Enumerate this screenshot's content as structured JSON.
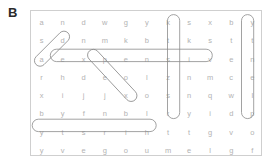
{
  "panel": {
    "label": "B"
  },
  "colors": {
    "letter": "#b3b3b3",
    "border": "#cfcfcf",
    "circle": "#8a8a8a",
    "label": "#2b2b2b",
    "background": "#ffffff"
  },
  "puzzle": {
    "rows": 8,
    "cols": 11,
    "grid": [
      [
        "a",
        "n",
        "d",
        "w",
        "g",
        "y",
        "k",
        "s",
        "x",
        "b",
        "y"
      ],
      [
        "s",
        "d",
        "n",
        "m",
        "k",
        "b",
        "t",
        "k",
        "s",
        "t",
        "t"
      ],
      [
        "a",
        "e",
        "x",
        "p",
        "e",
        "n",
        "s",
        "i",
        "v",
        "e",
        "n"
      ],
      [
        "r",
        "h",
        "d",
        "e",
        "o",
        "l",
        "z",
        "n",
        "m",
        "c",
        "e"
      ],
      [
        "x",
        "i",
        "j",
        "j",
        "x",
        "o",
        "s",
        "n",
        "q",
        "w",
        "l"
      ],
      [
        "b",
        "y",
        "f",
        "n",
        "b",
        "l",
        "r",
        "y",
        "i",
        "d",
        "p"
      ],
      [
        "y",
        "t",
        "s",
        "r",
        "i",
        "h",
        "t",
        "t",
        "g",
        "v",
        "o"
      ],
      [
        "y",
        "v",
        "e",
        "g",
        "o",
        "u",
        "m",
        "e",
        "l",
        "g",
        "f"
      ]
    ],
    "rows_text": [
      "a n d w g y k s x b y",
      "s d n m k b t k s t t",
      "a e x p e n s i v e n",
      "r h d e o l z n m c e",
      "x i j j x o s n q w l",
      "b y f n b l r y i d p",
      "y t s r i h t t g v o",
      "y v e g o u m e l g f"
    ],
    "found_words": [
      {
        "id": "add",
        "text": "add",
        "display": "d d a",
        "direction": "diagonal-down-left",
        "start": {
          "row": 1,
          "col": 3
        },
        "end": {
          "row": 3,
          "col": 1
        }
      },
      {
        "id": "expensive",
        "text": "expensive",
        "display": "e x p e n s i v e",
        "direction": "horizontal",
        "start": {
          "row": 3,
          "col": 2
        },
        "end": {
          "row": 3,
          "col": 10
        }
      },
      {
        "id": "poor",
        "text": "poor",
        "display": "p o o r",
        "direction": "diagonal-down-right",
        "start": {
          "row": 3,
          "col": 4
        },
        "end": {
          "row": 6,
          "col": 7
        }
      },
      {
        "id": "skinny",
        "text": "skinny",
        "display": "s k i n n y",
        "direction": "vertical",
        "start": {
          "row": 1,
          "col": 8
        },
        "end": {
          "row": 6,
          "col": 8
        }
      },
      {
        "id": "plenty",
        "text": "plenty",
        "display": "y t n e l p",
        "direction": "vertical-reversed",
        "start": {
          "row": 1,
          "col": 11
        },
        "end": {
          "row": 6,
          "col": 11
        }
      },
      {
        "id": "thirsty",
        "text": "thirsty",
        "display": "y t s r i h t",
        "direction": "horizontal-reversed",
        "start": {
          "row": 7,
          "col": 1
        },
        "end": {
          "row": 7,
          "col": 7
        }
      }
    ]
  }
}
